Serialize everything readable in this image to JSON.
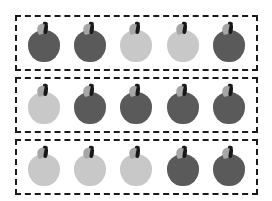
{
  "canvas": {
    "width": 272,
    "height": 201,
    "background": "#ffffff"
  },
  "style": {
    "group_border_color": "#1a1a1a",
    "group_border_style": "dashed",
    "group_border_width": 2,
    "apple_dark_color": "#5a5a5a",
    "apple_light_color": "#c8c8c8",
    "leaf_color": "#a6a6a6",
    "stem_color": "#181818"
  },
  "legend": {
    "dark_label": "dark apple",
    "light_label": "light apple"
  },
  "groups": [
    {
      "name": "group-row-1",
      "count": 5,
      "dark_count": 3,
      "light_count": 2,
      "apples": [
        {
          "shade": "dark",
          "color": "#5a5a5a"
        },
        {
          "shade": "dark",
          "color": "#5a5a5a"
        },
        {
          "shade": "light",
          "color": "#c8c8c8"
        },
        {
          "shade": "light",
          "color": "#c8c8c8"
        },
        {
          "shade": "dark",
          "color": "#5a5a5a"
        }
      ]
    },
    {
      "name": "group-row-2",
      "count": 5,
      "dark_count": 4,
      "light_count": 1,
      "apples": [
        {
          "shade": "light",
          "color": "#c8c8c8"
        },
        {
          "shade": "dark",
          "color": "#5a5a5a"
        },
        {
          "shade": "dark",
          "color": "#5a5a5a"
        },
        {
          "shade": "dark",
          "color": "#5a5a5a"
        },
        {
          "shade": "dark",
          "color": "#5a5a5a"
        }
      ]
    },
    {
      "name": "group-row-3",
      "count": 5,
      "dark_count": 2,
      "light_count": 3,
      "apples": [
        {
          "shade": "light",
          "color": "#c8c8c8"
        },
        {
          "shade": "light",
          "color": "#c8c8c8"
        },
        {
          "shade": "light",
          "color": "#c8c8c8"
        },
        {
          "shade": "dark",
          "color": "#5a5a5a"
        },
        {
          "shade": "dark",
          "color": "#5a5a5a"
        }
      ]
    }
  ],
  "totals": {
    "groups": 3,
    "apples_per_group": 5,
    "total_apples": 15,
    "total_dark": 9,
    "total_light": 6
  }
}
